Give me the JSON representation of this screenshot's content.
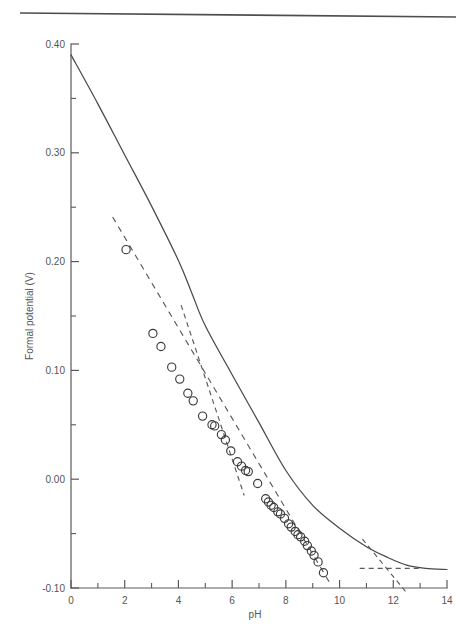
{
  "figure": {
    "top_rule": true,
    "background_color": "#ffffff",
    "line_color": "#4a4a4a"
  },
  "chart_data": {
    "type": "scatter",
    "title": "",
    "subtitle": "",
    "xlabel": "pH",
    "ylabel": "Formal potential (V)",
    "xlim": [
      0,
      14
    ],
    "ylim": [
      -0.1,
      0.4
    ],
    "grid": false,
    "legend": "none",
    "x_ticks_major": [
      0,
      2,
      4,
      6,
      8,
      10,
      12,
      14
    ],
    "x_tick_labels": [
      "0",
      "2",
      "4",
      "6",
      "8",
      "10",
      "12",
      "14"
    ],
    "x_ticks_minor": [
      1,
      3,
      5,
      7,
      9,
      11,
      13
    ],
    "y_ticks_major": [
      0.4,
      0.3,
      0.2,
      0.1,
      0.0,
      -0.1
    ],
    "y_tick_labels": [
      "0.40",
      "0.30",
      "0.20",
      "0.10",
      "0.00",
      "-0.10"
    ],
    "y_ticks_minor": [
      0.35,
      0.25,
      0.15,
      0.05,
      -0.05
    ],
    "series": [
      {
        "name": "measured formal potential",
        "style": "open-circle markers",
        "marker": "circle-open",
        "points": [
          {
            "x": 2.05,
            "y": 0.211
          },
          {
            "x": 3.05,
            "y": 0.134
          },
          {
            "x": 3.35,
            "y": 0.122
          },
          {
            "x": 3.75,
            "y": 0.103
          },
          {
            "x": 4.05,
            "y": 0.092
          },
          {
            "x": 4.35,
            "y": 0.079
          },
          {
            "x": 4.55,
            "y": 0.072
          },
          {
            "x": 4.9,
            "y": 0.058
          },
          {
            "x": 5.25,
            "y": 0.05
          },
          {
            "x": 5.35,
            "y": 0.049
          },
          {
            "x": 5.6,
            "y": 0.041
          },
          {
            "x": 5.75,
            "y": 0.036
          },
          {
            "x": 5.95,
            "y": 0.026
          },
          {
            "x": 6.2,
            "y": 0.016
          },
          {
            "x": 6.35,
            "y": 0.012
          },
          {
            "x": 6.5,
            "y": 0.008
          },
          {
            "x": 6.6,
            "y": 0.007
          },
          {
            "x": 6.95,
            "y": -0.004
          },
          {
            "x": 7.25,
            "y": -0.018
          },
          {
            "x": 7.35,
            "y": -0.021
          },
          {
            "x": 7.45,
            "y": -0.024
          },
          {
            "x": 7.55,
            "y": -0.026
          },
          {
            "x": 7.7,
            "y": -0.03
          },
          {
            "x": 7.8,
            "y": -0.032
          },
          {
            "x": 7.95,
            "y": -0.036
          },
          {
            "x": 8.1,
            "y": -0.041
          },
          {
            "x": 8.2,
            "y": -0.044
          },
          {
            "x": 8.35,
            "y": -0.048
          },
          {
            "x": 8.45,
            "y": -0.051
          },
          {
            "x": 8.55,
            "y": -0.053
          },
          {
            "x": 8.7,
            "y": -0.057
          },
          {
            "x": 8.8,
            "y": -0.061
          },
          {
            "x": 8.95,
            "y": -0.066
          },
          {
            "x": 9.05,
            "y": -0.07
          },
          {
            "x": 9.2,
            "y": -0.076
          },
          {
            "x": 9.4,
            "y": -0.086
          }
        ]
      },
      {
        "name": "theoretical curve",
        "style": "solid",
        "points": [
          {
            "x": 0.0,
            "y": 0.39
          },
          {
            "x": 1.0,
            "y": 0.345
          },
          {
            "x": 2.0,
            "y": 0.298
          },
          {
            "x": 3.0,
            "y": 0.251
          },
          {
            "x": 4.0,
            "y": 0.201
          },
          {
            "x": 4.5,
            "y": 0.171
          },
          {
            "x": 5.0,
            "y": 0.141
          },
          {
            "x": 6.0,
            "y": 0.096
          },
          {
            "x": 7.0,
            "y": 0.052
          },
          {
            "x": 8.0,
            "y": 0.008
          },
          {
            "x": 9.0,
            "y": -0.024
          },
          {
            "x": 10.0,
            "y": -0.045
          },
          {
            "x": 11.0,
            "y": -0.062
          },
          {
            "x": 11.8,
            "y": -0.072
          },
          {
            "x": 12.5,
            "y": -0.079
          },
          {
            "x": 13.2,
            "y": -0.082
          },
          {
            "x": 14.0,
            "y": -0.083
          }
        ]
      },
      {
        "name": "asymptote low-pH slope",
        "style": "dashed",
        "points": [
          {
            "x": 1.55,
            "y": 0.241
          },
          {
            "x": 9.7,
            "y": -0.098
          }
        ]
      },
      {
        "name": "asymptote mid-pH slope",
        "style": "dashed",
        "points": [
          {
            "x": 4.1,
            "y": 0.16
          },
          {
            "x": 6.45,
            "y": -0.015
          }
        ]
      },
      {
        "name": "asymptote high-pH steep",
        "style": "dashed",
        "points": [
          {
            "x": 10.85,
            "y": -0.055
          },
          {
            "x": 12.45,
            "y": -0.103
          }
        ]
      },
      {
        "name": "asymptote high-pH plateau",
        "style": "dashed",
        "points": [
          {
            "x": 10.75,
            "y": -0.082
          },
          {
            "x": 13.05,
            "y": -0.082
          }
        ]
      }
    ]
  }
}
